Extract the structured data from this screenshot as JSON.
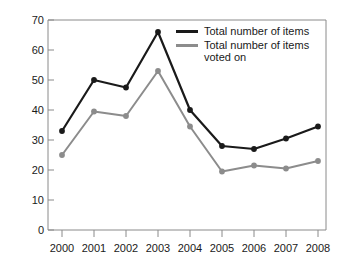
{
  "chart_data": {
    "type": "line",
    "title": "",
    "xlabel": "",
    "ylabel": "",
    "categories": [
      "2000",
      "2001",
      "2002",
      "2003",
      "2004",
      "2005",
      "2006",
      "2007",
      "2008"
    ],
    "x": [
      2000,
      2001,
      2002,
      2003,
      2004,
      2005,
      2006,
      2007,
      2008
    ],
    "series": [
      {
        "name": "Total number of items",
        "color": "#1a1a1a",
        "values": [
          33,
          50,
          47.5,
          66,
          40,
          28,
          27,
          30.5,
          34.5
        ]
      },
      {
        "name": "Total number of items voted on",
        "color": "#8c8c8c",
        "values": [
          25,
          39.5,
          38,
          53,
          34.5,
          19.5,
          21.5,
          20.5,
          23
        ]
      }
    ],
    "ylim": [
      0,
      70
    ],
    "yticks": [
      0,
      10,
      20,
      30,
      40,
      50,
      60,
      70
    ],
    "ytick_labels": [
      "0",
      "10",
      "20",
      "30",
      "40",
      "50",
      "60",
      "70"
    ],
    "xtick_labels": [
      "2000",
      "2001",
      "2002",
      "2003",
      "2004",
      "2005",
      "2006",
      "2007",
      "2008"
    ],
    "grid": false,
    "legend_position": "top-right",
    "markers": true
  },
  "legend": {
    "entries": [
      {
        "label": "Total number of items",
        "color": "#1a1a1a",
        "swatch": "line-swatch-black"
      },
      {
        "label": "Total number of items voted on",
        "color": "#8c8c8c",
        "swatch": "line-swatch-gray"
      }
    ]
  },
  "axes": {
    "y_ticks": [
      "70",
      "60",
      "50",
      "40",
      "30",
      "20",
      "10",
      "0"
    ],
    "x_ticks": [
      "2000",
      "2001",
      "2002",
      "2003",
      "2004",
      "2005",
      "2006",
      "2007",
      "2008"
    ]
  }
}
